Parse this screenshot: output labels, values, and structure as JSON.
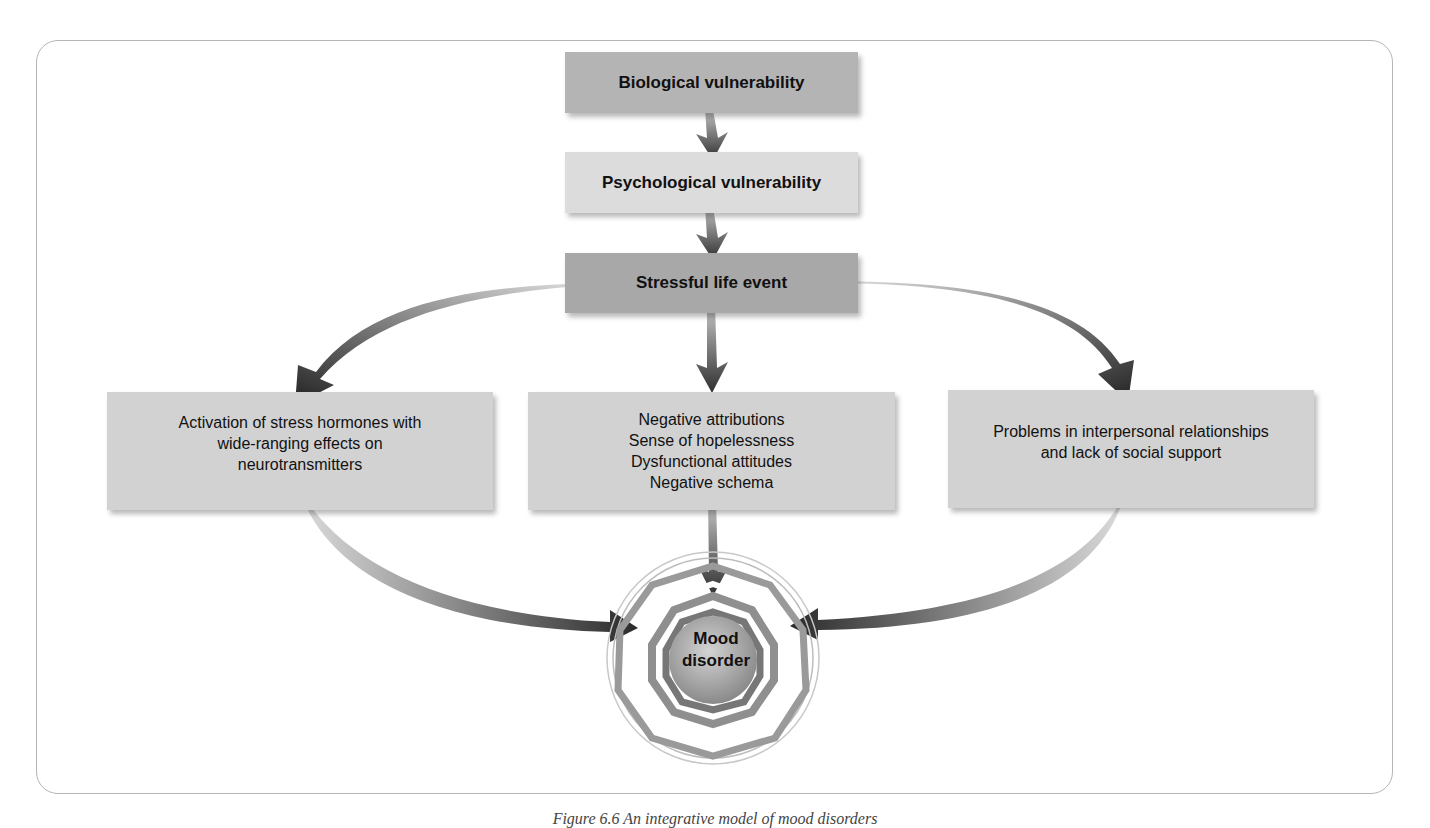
{
  "diagram": {
    "type": "flowchart",
    "title": "Integrative model of mood disorders",
    "top_chain": [
      {
        "id": "bio",
        "label": "Biological vulnerability"
      },
      {
        "id": "psych",
        "label": "Psychological vulnerability"
      },
      {
        "id": "stress",
        "label": "Stressful life event"
      }
    ],
    "branches": {
      "left": {
        "lines": [
          "Activation of stress hormones with",
          "wide-ranging effects on",
          "neurotransmitters"
        ]
      },
      "middle": {
        "lines": [
          "Negative attributions",
          "Sense of hopelessness",
          "Dysfunctional attitudes",
          "Negative schema"
        ]
      },
      "right": {
        "lines": [
          "Problems in interpersonal relationships",
          "and lack of social support"
        ]
      }
    },
    "outcome": {
      "lines": [
        "Mood",
        "disorder"
      ]
    },
    "edges": [
      {
        "from": "bio",
        "to": "psych"
      },
      {
        "from": "psych",
        "to": "stress"
      },
      {
        "from": "stress",
        "to": "left"
      },
      {
        "from": "stress",
        "to": "middle"
      },
      {
        "from": "stress",
        "to": "right"
      },
      {
        "from": "left",
        "to": "outcome"
      },
      {
        "from": "middle",
        "to": "outcome"
      },
      {
        "from": "right",
        "to": "outcome"
      }
    ],
    "colors": {
      "bio_box": "#b4b4b4",
      "psych_box": "#dcdcdc",
      "stress_box": "#a8a8a8",
      "branch_box": "#d2d2d2",
      "arrow_dark": "#2a2a2a",
      "arrow_light": "#b8b8b8",
      "frame": "#b5b5b5"
    }
  },
  "caption": "Figure 6.6 An integrative model of mood disorders"
}
